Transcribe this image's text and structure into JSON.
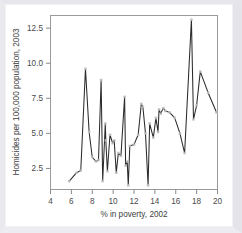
{
  "figure": {
    "name": "scatter-line-plot",
    "background_color": "#ffffff",
    "frame_color": "#e6e6ec",
    "axis_color": "#8a8a8a",
    "line_color": "#2b2b2b",
    "marker_color": "#bdbdbd"
  },
  "chart_data": {
    "type": "line",
    "title": "",
    "subtitle": "",
    "xlabel": "% in poverty, 2002",
    "ylabel": "Homicides per 100,000 population, 2003",
    "xlim": [
      4,
      20
    ],
    "ylim": [
      1.0,
      13.4
    ],
    "xticks": [
      4,
      6,
      8,
      10,
      12,
      14,
      16,
      18,
      20
    ],
    "xtick_labels": [
      "4",
      "6",
      "8",
      "10",
      "12",
      "14",
      "16",
      "18",
      "20"
    ],
    "yticks": [
      2.5,
      5.0,
      7.5,
      10.0,
      12.5
    ],
    "ytick_labels": [
      "2.5",
      "5.0",
      "7.5",
      "10.0",
      "12.5"
    ],
    "grid": false,
    "legend": null,
    "markers": true,
    "x": [
      5.8,
      6.5,
      6.9,
      7.35,
      7.7,
      8.0,
      8.35,
      8.6,
      8.85,
      9.0,
      9.25,
      9.3,
      9.45,
      9.7,
      9.95,
      10.1,
      10.3,
      10.5,
      10.75,
      11.1,
      11.2,
      11.35,
      11.45,
      11.6,
      12.0,
      12.4,
      12.7,
      12.85,
      13.1,
      13.35,
      13.5,
      13.85,
      14.1,
      14.3,
      14.4,
      14.55,
      14.8,
      15.0,
      15.4,
      15.9,
      16.4,
      16.85,
      17.5,
      17.7,
      18.0,
      18.35,
      19.1,
      19.9
    ],
    "y": [
      1.6,
      2.2,
      2.35,
      9.6,
      5.1,
      3.3,
      3.0,
      3.1,
      8.8,
      1.6,
      5.7,
      4.5,
      2.3,
      4.9,
      4.3,
      4.5,
      2.2,
      3.6,
      3.4,
      7.6,
      2.7,
      3.0,
      1.3,
      4.1,
      4.2,
      4.9,
      7.1,
      6.9,
      5.0,
      1.3,
      5.7,
      4.7,
      6.1,
      5.1,
      6.7,
      6.4,
      6.8,
      6.6,
      6.5,
      6.1,
      5.0,
      3.6,
      13.1,
      6.0,
      7.0,
      9.4,
      7.9,
      6.5
    ]
  },
  "axes": {
    "x_axis_name": "x-axis",
    "y_axis_name": "y-axis"
  }
}
